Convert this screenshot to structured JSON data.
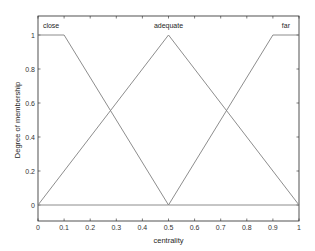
{
  "chart_data": {
    "type": "line",
    "title": "",
    "xlabel": "centrality",
    "ylabel": "Degree of membership",
    "xlim": [
      0,
      1
    ],
    "ylim": [
      0,
      1
    ],
    "xticks": [
      "0",
      "0.1",
      "0.2",
      "0.3",
      "0.4",
      "0.5",
      "0.6",
      "0.7",
      "0.8",
      "0.9",
      "1"
    ],
    "yticks": [
      "0",
      "0.2",
      "0.4",
      "0.6",
      "0.8",
      "1"
    ],
    "grid": false,
    "legend": "none (labels drawn above each membership function)",
    "line_color": "#808080",
    "series": [
      {
        "name": "close",
        "shape": "trapmf",
        "params": [
          0,
          0,
          0.1,
          0.5
        ],
        "x": [
          0,
          0.1,
          0.5,
          1
        ],
        "y": [
          1,
          1,
          0,
          0
        ],
        "label_x": 0.05
      },
      {
        "name": "adequate",
        "shape": "trimf",
        "params": [
          0,
          0.5,
          1
        ],
        "x": [
          0,
          0.5,
          1
        ],
        "y": [
          0,
          1,
          0
        ],
        "label_x": 0.5
      },
      {
        "name": "far",
        "shape": "trapmf",
        "params": [
          0.5,
          0.9,
          1,
          1
        ],
        "x": [
          0,
          0.5,
          0.9,
          1
        ],
        "y": [
          0,
          0,
          1,
          1
        ],
        "label_x": 0.95
      }
    ]
  }
}
